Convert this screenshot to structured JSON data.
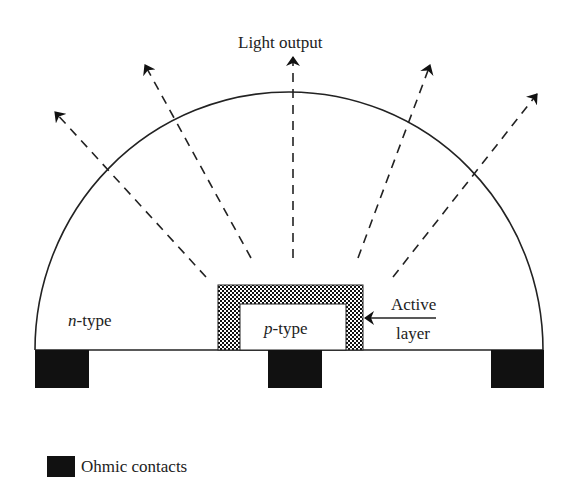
{
  "labels": {
    "light_output": "Light output",
    "n_type_prefix": "n",
    "n_type_suffix": "-type",
    "p_type_prefix": "p",
    "p_type_suffix": "-type",
    "active_line1": "Active",
    "active_line2": "layer"
  },
  "legend": {
    "items": [
      {
        "label": "Ohmic contacts",
        "color": "#111111"
      }
    ]
  },
  "colors": {
    "stroke": "#222222",
    "contact": "#111111",
    "background": "#ffffff"
  },
  "components": {
    "dome": "semicircular n-type region",
    "chip": "p-type region with hatched active layer",
    "contacts": 3,
    "light_rays": 5
  }
}
